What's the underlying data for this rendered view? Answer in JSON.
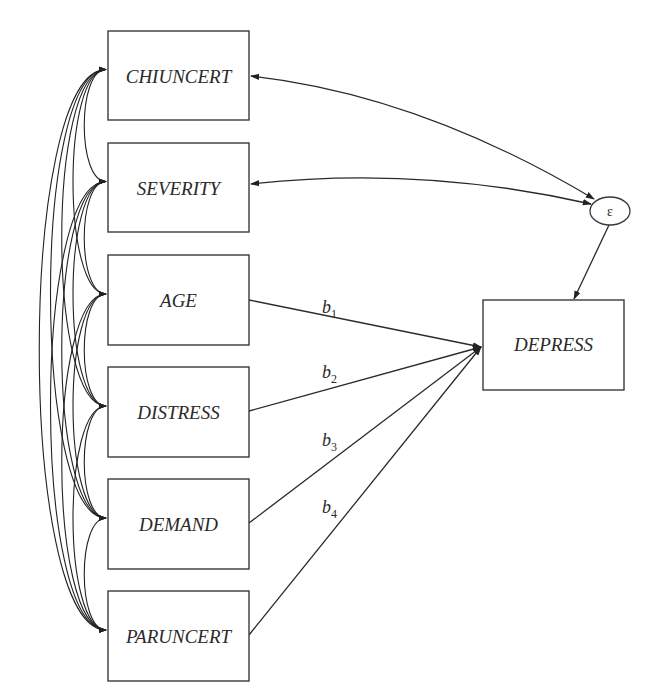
{
  "diagram": {
    "type": "path-diagram",
    "predictors": [
      {
        "id": "chiuncert",
        "label": "CHIUNCERT",
        "x": 108,
        "y": 31,
        "w": 141,
        "h": 89
      },
      {
        "id": "severity",
        "label": "SEVERITY",
        "x": 108,
        "y": 143,
        "w": 141,
        "h": 89
      },
      {
        "id": "age",
        "label": "AGE",
        "x": 108,
        "y": 255,
        "w": 141,
        "h": 90
      },
      {
        "id": "distress",
        "label": "DISTRESS",
        "x": 108,
        "y": 367,
        "w": 141,
        "h": 90
      },
      {
        "id": "demand",
        "label": "DEMAND",
        "x": 108,
        "y": 479,
        "w": 141,
        "h": 90
      },
      {
        "id": "paruncert",
        "label": "PARUNCERT",
        "x": 108,
        "y": 591,
        "w": 141,
        "h": 90
      }
    ],
    "outcome": {
      "id": "depress",
      "label": "DEPRESS",
      "x": 483,
      "y": 300,
      "w": 141,
      "h": 90
    },
    "error": {
      "id": "epsilon",
      "label": "ε",
      "cx": 610,
      "cy": 211,
      "rx": 20,
      "ry": 14
    },
    "paths": [
      {
        "from": "age",
        "to": "depress",
        "coef": "b",
        "sub": "1"
      },
      {
        "from": "distress",
        "to": "depress",
        "coef": "b",
        "sub": "2"
      },
      {
        "from": "demand",
        "to": "depress",
        "coef": "b",
        "sub": "3"
      },
      {
        "from": "paruncert",
        "to": "depress",
        "coef": "b",
        "sub": "4"
      }
    ],
    "error_covariances": [
      "chiuncert",
      "severity"
    ],
    "note": "All predictors are mutually correlated (curved two-headed arrows on left)"
  }
}
